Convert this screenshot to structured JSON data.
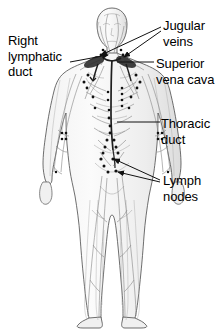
{
  "figure": {
    "background_color": "#ffffff",
    "line_color": "#1a1a1a",
    "vessel_color": "#8a8a8a",
    "node_color": "#111111",
    "body_outline_color": "#555555",
    "width": 224,
    "height": 329
  },
  "labels": [
    {
      "id": "right-lymphatic-duct",
      "text": "Right\nlymphatic\nduct",
      "x": 8,
      "y": 33,
      "align": "left"
    },
    {
      "id": "jugular-veins",
      "text": "Jugular\nveins",
      "x": 163,
      "y": 18,
      "align": "left"
    },
    {
      "id": "superior-vena-cava",
      "text": "Superior\nvena cava",
      "x": 156,
      "y": 56,
      "align": "left"
    },
    {
      "id": "thoracic-duct",
      "text": "Thoracic\nduct",
      "x": 161,
      "y": 116,
      "align": "left"
    },
    {
      "id": "lymph-nodes",
      "text": "Lymph\nnodes",
      "x": 163,
      "y": 173,
      "align": "left"
    }
  ],
  "leader_lines": [
    {
      "id": "leader-right-lymphatic-duct",
      "from": [
        70,
        60
      ],
      "to": [
        110,
        55
      ],
      "arrow": true
    },
    {
      "id": "leader-jugular-veins-left",
      "from": [
        162,
        27
      ],
      "to": [
        100,
        56
      ],
      "arrow": true
    },
    {
      "id": "leader-jugular-veins-right",
      "from": [
        162,
        31
      ],
      "to": [
        122,
        58
      ],
      "arrow": true
    },
    {
      "id": "leader-superior-vena-cava",
      "from": [
        154,
        62
      ],
      "to": [
        116,
        62
      ],
      "arrow": false
    },
    {
      "id": "leader-thoracic-duct",
      "from": [
        160,
        122
      ],
      "to": [
        118,
        122
      ],
      "arrow": false
    },
    {
      "id": "leader-lymph-nodes-upper",
      "from": [
        160,
        180
      ],
      "to": [
        113,
        159
      ],
      "arrow": true
    },
    {
      "id": "leader-lymph-nodes-lower",
      "from": [
        160,
        182
      ],
      "to": [
        116,
        172
      ],
      "arrow": true
    }
  ],
  "anatomy": {
    "figure_description": "Anterior view of a standing human body showing the lymphatic vessel network and lymph nodes",
    "node_clusters": [
      {
        "name": "cervical-nodes",
        "count": 6
      },
      {
        "name": "axillary-nodes-left",
        "count": 5
      },
      {
        "name": "axillary-nodes-right",
        "count": 5
      },
      {
        "name": "mediastinal-nodes",
        "count": 7
      },
      {
        "name": "cubital-nodes-left",
        "count": 4
      },
      {
        "name": "cubital-nodes-right",
        "count": 4
      },
      {
        "name": "abdominal-nodes",
        "count": 8
      },
      {
        "name": "inguinal-nodes-left",
        "count": 6
      },
      {
        "name": "inguinal-nodes-right",
        "count": 6
      }
    ]
  }
}
